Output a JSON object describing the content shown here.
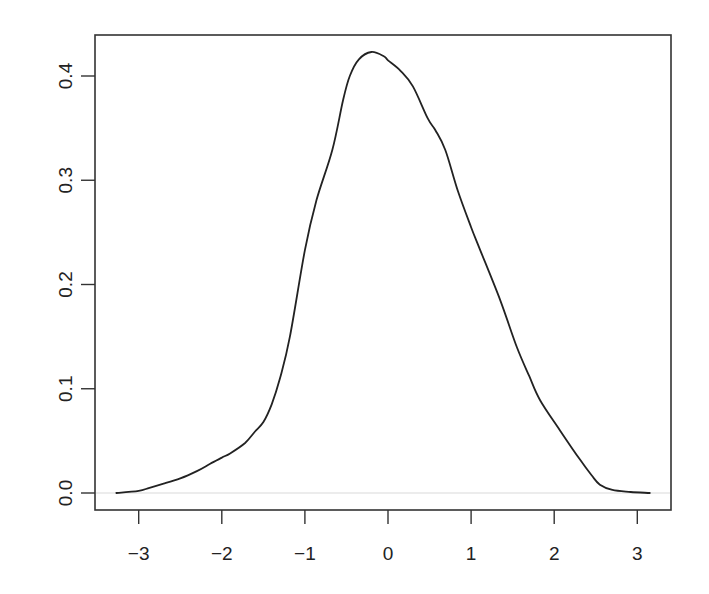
{
  "chart_data": {
    "type": "line",
    "title": "",
    "xlabel": "",
    "ylabel": "",
    "xlim": [
      -3.35,
      3.5
    ],
    "ylim": [
      -0.017,
      0.439
    ],
    "grid": false,
    "legend": null,
    "x_ticks": [
      -3,
      -2,
      -1,
      0,
      1,
      2,
      3
    ],
    "x_tick_labels": [
      "−3",
      "−2",
      "−1",
      "0",
      "1",
      "2",
      "3"
    ],
    "y_ticks": [
      0.0,
      0.1,
      0.2,
      0.3,
      0.4
    ],
    "y_tick_labels": [
      "0.0",
      "0.1",
      "0.2",
      "0.3",
      "0.4"
    ],
    "reference_lines": [
      {
        "axis": "y",
        "value": 0.0,
        "color": "#d9d9d9"
      }
    ],
    "series": [
      {
        "name": "density",
        "color": "#222222",
        "x": [
          -3.27,
          -3.0,
          -2.87,
          -2.7,
          -2.5,
          -2.3,
          -2.14,
          -2.0,
          -1.9,
          -1.72,
          -1.6,
          -1.5,
          -1.4,
          -1.3,
          -1.18,
          -1.0,
          -0.86,
          -0.67,
          -0.54,
          -0.46,
          -0.35,
          -0.2,
          -0.05,
          0.0,
          0.15,
          0.3,
          0.48,
          0.57,
          0.69,
          0.84,
          1.0,
          1.11,
          1.35,
          1.55,
          1.7,
          1.83,
          2.07,
          2.31,
          2.45,
          2.55,
          2.7,
          2.92,
          3.15
        ],
        "y": [
          0.0,
          0.002,
          0.005,
          0.009,
          0.014,
          0.021,
          0.028,
          0.034,
          0.038,
          0.048,
          0.059,
          0.068,
          0.085,
          0.11,
          0.15,
          0.233,
          0.281,
          0.329,
          0.377,
          0.4,
          0.416,
          0.423,
          0.419,
          0.415,
          0.405,
          0.39,
          0.359,
          0.348,
          0.329,
          0.29,
          0.255,
          0.233,
          0.185,
          0.14,
          0.112,
          0.089,
          0.06,
          0.032,
          0.017,
          0.008,
          0.003,
          0.001,
          0.0
        ]
      }
    ]
  }
}
